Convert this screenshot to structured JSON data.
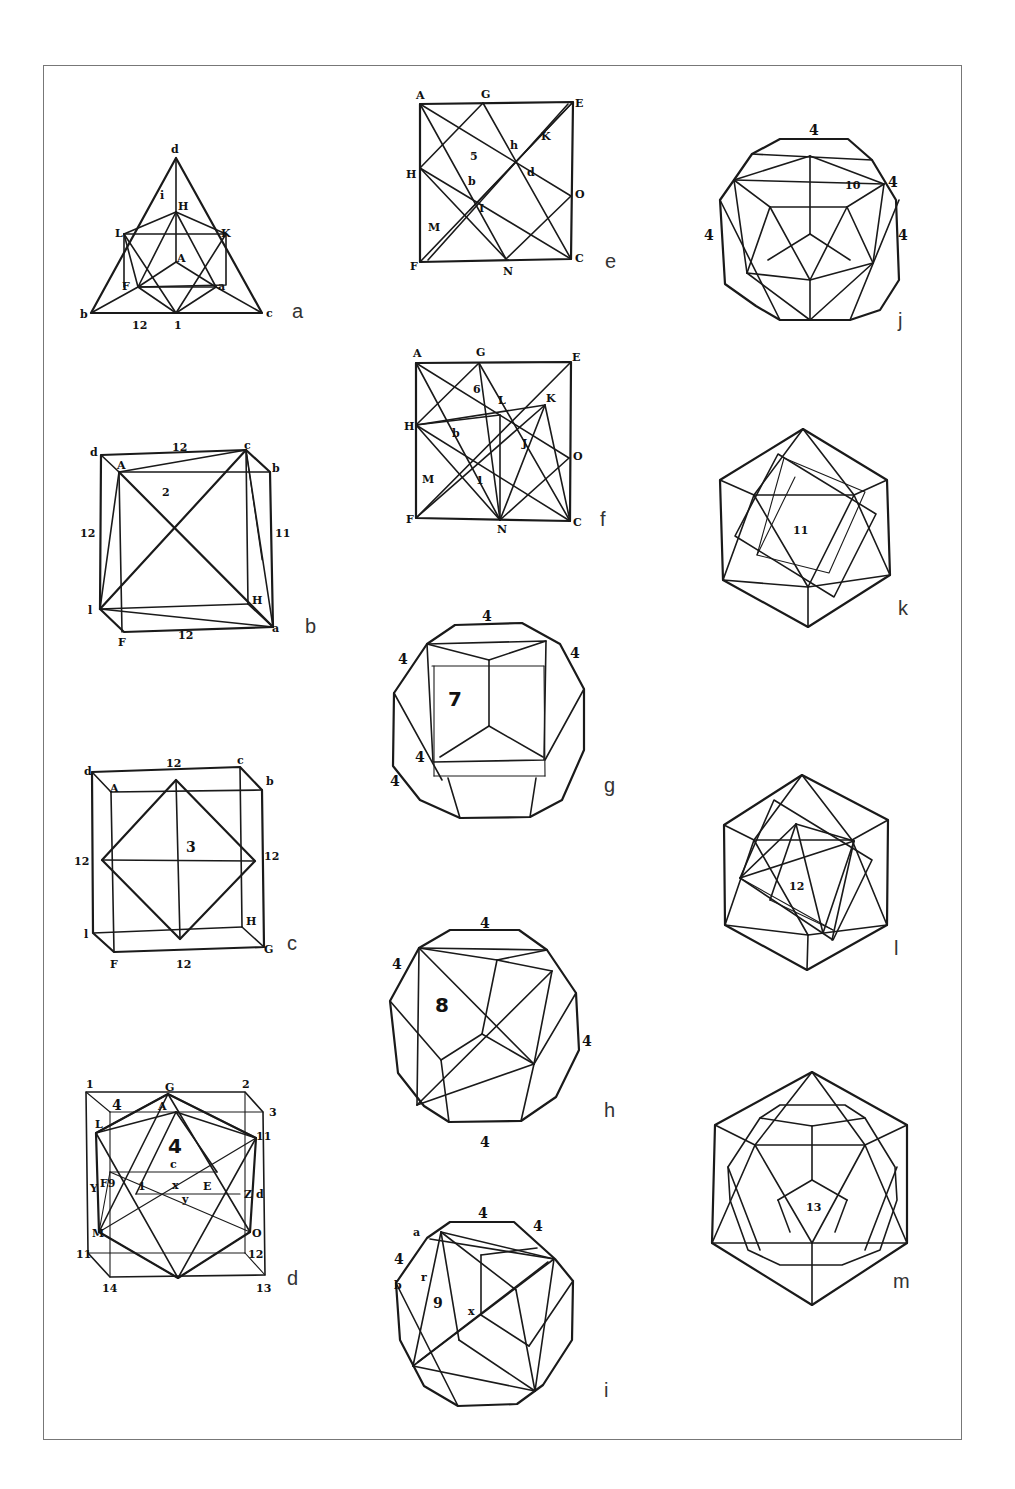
{
  "plate": {
    "border_color": "#777777",
    "line_color": "#1a1a1a"
  },
  "figures": {
    "a": {
      "caption": "a",
      "description": "triangle with inscribed octahedron",
      "labels": {
        "d": "d",
        "i": "i",
        "H": "H",
        "L": "L",
        "K": "K",
        "A": "A",
        "F": "F",
        "g": "a",
        "b": "b",
        "c": "c",
        "n12": "12",
        "one": "1"
      }
    },
    "b": {
      "caption": "b",
      "description": "cube with inscribed tetrahedron",
      "labels": {
        "d": "d",
        "A": "A",
        "c": "c",
        "b": "b",
        "top12": "12",
        "z": "2",
        "left12": "12",
        "right12": "11",
        "l": "l",
        "H": "H",
        "g": "a",
        "F": "F",
        "bottom12": "12"
      }
    },
    "c": {
      "caption": "c",
      "description": "cube with inscribed octahedron",
      "labels": {
        "d": "d",
        "A": "A",
        "top12": "12",
        "c": "c",
        "b": "b",
        "three": "3",
        "left12": "12",
        "right12": "12",
        "l": "l",
        "H": "H",
        "g": "G",
        "F": "F",
        "bottom12": "12"
      }
    },
    "d": {
      "caption": "d",
      "description": "cube with inscribed icosahedron",
      "labels": {
        "one": "1",
        "G": "G",
        "z": "2",
        "four_a": "4",
        "A": "A",
        "L": "L",
        "three": "3",
        "four_b": "4",
        "eleven_r": "11",
        "c": "c",
        "Y": "Y",
        "F9": "F9",
        "i": "1",
        "x": "x",
        "E": "E",
        "Z": "Z",
        "dd": "d",
        "gam": "y",
        "M": "M",
        "O": "O",
        "eleven_l": "11",
        "twelve": "12",
        "fourteen": "14",
        "thirteen": "13"
      }
    },
    "e": {
      "caption": "e",
      "description": "square net construction",
      "labels": {
        "A": "A",
        "G": "G",
        "E": "E",
        "H": "H",
        "O": "O",
        "F": "F",
        "N": "N",
        "C": "C",
        "M": "M",
        "I": "I",
        "K": "K",
        "h": "h",
        "five": "5",
        "b": "b",
        "d": "d"
      }
    },
    "f": {
      "caption": "f",
      "description": "square net construction",
      "labels": {
        "A": "A",
        "G": "G",
        "E": "E",
        "six": "6",
        "L": "L",
        "K": "K",
        "H": "H",
        "b": "b",
        "J": "J",
        "O": "O",
        "M": "M",
        "i": "1",
        "F": "F",
        "N": "N",
        "C": "C"
      }
    },
    "g": {
      "caption": "g",
      "number": "7",
      "edge_labels": [
        "4",
        "4",
        "4",
        "4",
        "4"
      ]
    },
    "h": {
      "caption": "h",
      "number": "8",
      "edge_labels": [
        "4",
        "4",
        "4",
        "4"
      ]
    },
    "i": {
      "caption": "i",
      "number": "9",
      "edge_labels": [
        "4",
        "4",
        "4"
      ],
      "labels": {
        "a": "a",
        "b": "b",
        "r": "r",
        "x": "x"
      }
    },
    "j": {
      "caption": "j",
      "number": "10",
      "edge_labels": [
        "4",
        "4",
        "4",
        "4"
      ]
    },
    "k": {
      "caption": "k",
      "number": "11"
    },
    "l": {
      "caption": "l",
      "number": "12"
    },
    "m": {
      "caption": "m",
      "number": "13"
    }
  }
}
